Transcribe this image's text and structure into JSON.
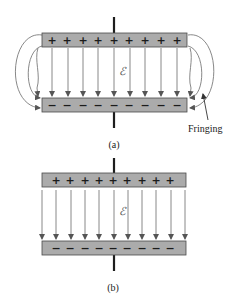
{
  "figure": {
    "panel_a": {
      "caption": "(a)",
      "top_plate": {
        "charge_sign": "+",
        "charge_count": 9
      },
      "bottom_plate": {
        "charge_sign": "−",
        "charge_count": 9
      },
      "field_symbol": "ℰ",
      "field_line_count": 11,
      "fringe_label": "Fringing",
      "has_fringing": true
    },
    "panel_b": {
      "caption": "(b)",
      "top_plate": {
        "charge_sign": "+",
        "charge_count": 9
      },
      "bottom_plate": {
        "charge_sign": "−",
        "charge_count": 9
      },
      "field_symbol": "ℰ",
      "field_line_count": 11,
      "has_fringing": false
    }
  },
  "colors": {
    "plate_fill": "#ababab",
    "plate_stroke": "#4a4a4a",
    "field_line": "#7a7a7a",
    "terminal": "#1e1e1e"
  }
}
